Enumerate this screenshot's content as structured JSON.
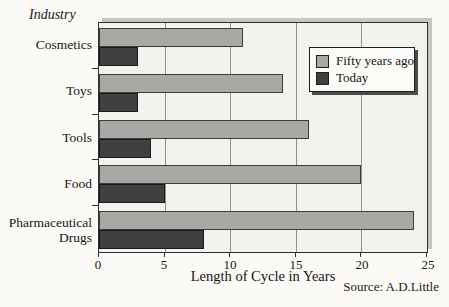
{
  "title": "Industry",
  "source": "Source: A.D.Little",
  "chart_data": {
    "type": "bar",
    "orientation": "horizontal",
    "title": "Industry",
    "categories": [
      "Cosmetics",
      "Toys",
      "Tools",
      "Food",
      "Pharmaceutical Drugs"
    ],
    "series": [
      {
        "name": "Fifty years ago",
        "color": "#a9a8a4",
        "values": [
          11,
          14,
          16,
          20,
          24
        ]
      },
      {
        "name": "Today",
        "color": "#3f3f3f",
        "values": [
          3,
          3,
          4,
          5,
          8
        ]
      }
    ],
    "xlabel": "Length of Cycle in Years",
    "xlim": [
      0,
      25
    ],
    "xticks": [
      0,
      5,
      10,
      15,
      20,
      25
    ],
    "grid": "vertical",
    "legend_position": "top-right",
    "source": "Source: A.D.Little"
  },
  "colors": {
    "plot_background": "#f3f2ee",
    "page_background": "#fbfaf7",
    "gridline": "#8f8f8f",
    "frame": "#2f2f2f",
    "bar_old": "#a9a8a4",
    "bar_today": "#3f3f3f"
  }
}
